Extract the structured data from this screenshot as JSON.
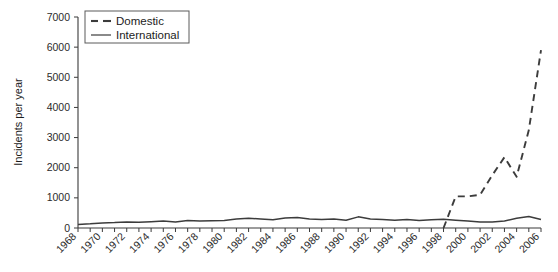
{
  "chart_data": {
    "type": "line",
    "title": "",
    "xlabel": "",
    "ylabel": "Incidents per year",
    "ylim": [
      0,
      7000
    ],
    "xlim": [
      1968,
      2006
    ],
    "grid": false,
    "legend_position": "top-left",
    "ytick_labels": [
      "0",
      "1000",
      "2000",
      "3000",
      "4000",
      "5000",
      "6000",
      "7000"
    ],
    "yticks": [
      0,
      1000,
      2000,
      3000,
      4000,
      5000,
      6000,
      7000
    ],
    "xtick_labels": [
      "1968",
      "1970",
      "1972",
      "1974",
      "1976",
      "1978",
      "1980",
      "1982",
      "1984",
      "1986",
      "1988",
      "1990",
      "1992",
      "1994",
      "1996",
      "1998",
      "2000",
      "2002",
      "2004",
      "2006"
    ],
    "x": [
      1968,
      1969,
      1970,
      1971,
      1972,
      1973,
      1974,
      1975,
      1976,
      1977,
      1978,
      1979,
      1980,
      1981,
      1982,
      1983,
      1984,
      1985,
      1986,
      1987,
      1988,
      1989,
      1990,
      1991,
      1992,
      1993,
      1994,
      1995,
      1996,
      1997,
      1998,
      1999,
      2000,
      2001,
      2002,
      2003,
      2004,
      2005,
      2006
    ],
    "series": [
      {
        "name": "Domestic",
        "style": "dashed",
        "color": "#3c3c3c",
        "x": [
          1998,
          1999,
          2000,
          2001,
          2002,
          2003,
          2004,
          2005,
          2006
        ],
        "values": [
          0,
          1050,
          1050,
          1100,
          1750,
          2350,
          1700,
          3250,
          5900
        ]
      },
      {
        "name": "International",
        "style": "solid",
        "color": "#3c3c3c",
        "x": [
          1968,
          1969,
          1970,
          1971,
          1972,
          1973,
          1974,
          1975,
          1976,
          1977,
          1978,
          1979,
          1980,
          1981,
          1982,
          1983,
          1984,
          1985,
          1986,
          1987,
          1988,
          1989,
          1990,
          1991,
          1992,
          1993,
          1994,
          1995,
          1996,
          1997,
          1998,
          1999,
          2000,
          2001,
          2002,
          2003,
          2004,
          2005,
          2006
        ],
        "values": [
          120,
          140,
          170,
          180,
          200,
          190,
          210,
          230,
          200,
          250,
          230,
          240,
          250,
          300,
          320,
          300,
          270,
          330,
          350,
          300,
          280,
          300,
          260,
          370,
          300,
          280,
          260,
          280,
          250,
          270,
          290,
          260,
          230,
          200,
          200,
          230,
          320,
          380,
          280
        ]
      }
    ]
  },
  "legend": {
    "entries": [
      {
        "label": "Domestic",
        "style": "dashed"
      },
      {
        "label": "International",
        "style": "solid"
      }
    ]
  }
}
